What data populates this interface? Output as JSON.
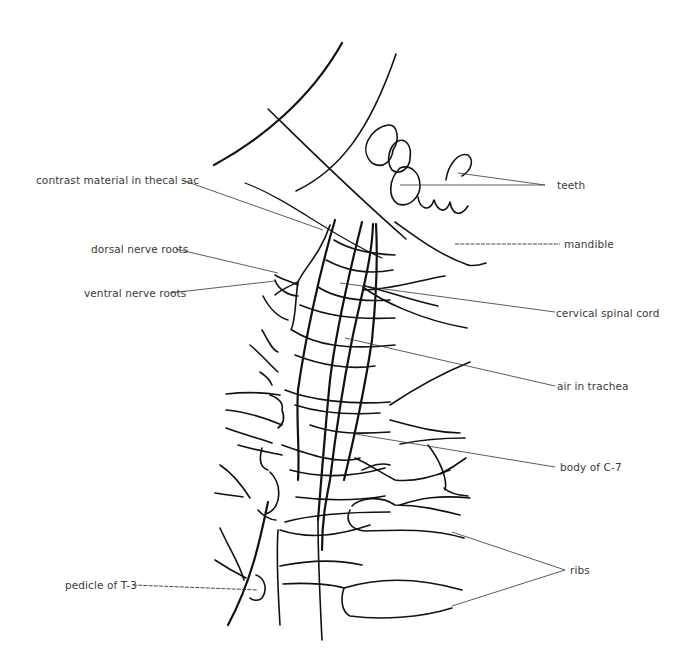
{
  "diagram": {
    "type": "anatomical line drawing",
    "background_color": "#ffffff",
    "line_color": "#111111",
    "label_color": "#3a3a3a"
  },
  "labels": {
    "contrast": "contrast material in thecal sac",
    "dorsal": "dorsal nerve roots",
    "ventral": "ventral nerve roots",
    "teeth": "teeth",
    "mandible": "mandible",
    "cord": "cervical spinal cord",
    "trachea": "air in trachea",
    "c7": "body of C-7",
    "ribs": "ribs",
    "pedicle": "pedicle of T-3"
  }
}
